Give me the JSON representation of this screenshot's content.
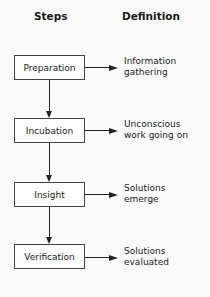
{
  "headers": {
    "steps": "Steps",
    "definition": "Definition"
  },
  "steps": [
    {
      "label": "Preparation",
      "definition": "Information\ngathering"
    },
    {
      "label": "Incubation",
      "definition": "Unconscious\nwork going on"
    },
    {
      "label": "Insight",
      "definition": "Solutions\nemerge"
    },
    {
      "label": "Verification",
      "definition": "Solutions\nevaluated"
    }
  ],
  "colors": {
    "line": "#222222",
    "box_border": "#444444",
    "background": "#fbfbfb"
  }
}
